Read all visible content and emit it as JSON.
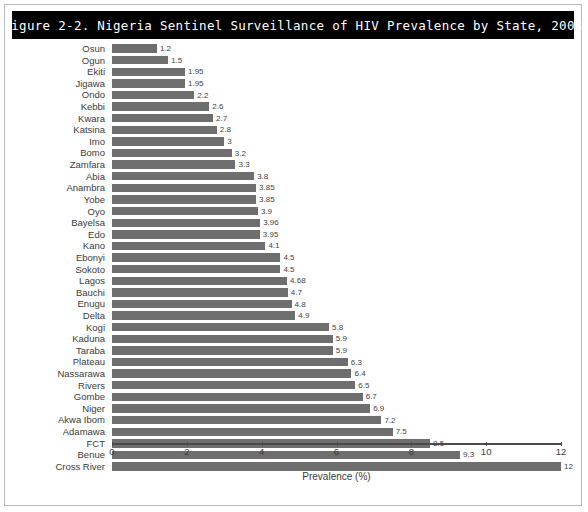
{
  "figure": {
    "title": "Figure 2-2. Nigeria Sentinel Surveillance of HIV Prevalence by State, 2003"
  },
  "chart_data": {
    "type": "bar",
    "orientation": "horizontal",
    "title": "Figure 2-2. Nigeria Sentinel Surveillance of HIV Prevalence by State, 2003",
    "xlabel": "Prevalence (%)",
    "ylabel": "",
    "xlim": [
      0,
      12
    ],
    "xticks": [
      0,
      2,
      4,
      6,
      8,
      10,
      12
    ],
    "xticklabels": [
      "0",
      "2",
      "4",
      "6",
      "8",
      "10",
      "12"
    ],
    "grid": false,
    "legend": null,
    "bar_color": "#6e6e6e",
    "categories": [
      "Osun",
      "Ogun",
      "Ekiti",
      "Jigawa",
      "Ondo",
      "Kebbi",
      "Kwara",
      "Katsina",
      "Imo",
      "Bomo",
      "Zamfara",
      "Abia",
      "Anambra",
      "Yobe",
      "Oyo",
      "Bayelsa",
      "Edo",
      "Kano",
      "Ebonyi",
      "Sokoto",
      "Lagos",
      "Bauchi",
      "Enugu",
      "Delta",
      "Kogi",
      "Kaduna",
      "Taraba",
      "Plateau",
      "Nassarawa",
      "Rivers",
      "Gombe",
      "Niger",
      "Akwa Ibom",
      "Adamawa",
      "FCT",
      "Benue",
      "Cross River"
    ],
    "values": [
      1.2,
      1.5,
      1.95,
      1.95,
      2.2,
      2.6,
      2.7,
      2.8,
      3,
      3.2,
      3.3,
      3.8,
      3.85,
      3.85,
      3.9,
      3.96,
      3.95,
      4.1,
      4.5,
      4.5,
      4.68,
      4.7,
      4.8,
      4.9,
      5.8,
      5.9,
      5.9,
      6.3,
      6.4,
      6.5,
      6.7,
      6.9,
      7.2,
      7.5,
      8.5,
      9.3,
      12
    ],
    "value_labels": [
      "1.2",
      "1.5",
      "1.95",
      "1.95",
      "2.2",
      "2.6",
      "2.7",
      "2.8",
      "3",
      "3.2",
      "3.3",
      "3.8",
      "3.85",
      "3.85",
      "3.9",
      "3.96",
      "3.95",
      "4.1",
      "4.5",
      "4.5",
      "4.68",
      "4.7",
      "4.8",
      "4.9",
      "5.8",
      "5.9",
      "5.9",
      "6.3",
      "6.4",
      "6.5",
      "6.7",
      "6.9",
      "7.2",
      "7.5",
      "8.5",
      "9.3",
      "12"
    ]
  }
}
